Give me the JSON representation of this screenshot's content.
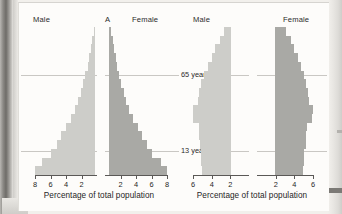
{
  "figures": [
    {
      "panel_label": "A",
      "male_label": "Male",
      "female_label": "Female",
      "axis_title": "Percentage of total population",
      "reference_lines": [
        {
          "label": "65 years",
          "value": 65
        },
        {
          "label": "13 years",
          "value": 13
        }
      ]
    },
    {
      "panel_label": "",
      "male_label": "Male",
      "female_label": "Female",
      "axis_title": "Percentage of total population",
      "reference_lines": [
        {
          "label": "65 years",
          "value": 65
        },
        {
          "label": "13 years",
          "value": 13
        }
      ]
    }
  ],
  "colors": {
    "male_bar": "#cdcdc9",
    "female_bar": "#a9a9a5",
    "axis": "#5a5856",
    "reference_line": "#c9c7c3",
    "page": "#fdfcfa",
    "text": "#1f1f1f"
  },
  "chart_data": [
    {
      "type": "bar",
      "title": "A",
      "subtitle": "Expansive population pyramid",
      "orientation": "horizontal-pyramid",
      "xlabel": "Percentage of total population",
      "ylabel": "Age group",
      "xlim": [
        -8,
        8
      ],
      "grid": false,
      "legend": "none",
      "left_side_label": "Male",
      "right_side_label": "Female",
      "xticks_left": [
        8,
        6,
        4,
        2
      ],
      "xticks_right": [
        2,
        4,
        6,
        8
      ],
      "categories": [
        "0-4",
        "5-9",
        "10-14",
        "15-19",
        "20-24",
        "25-29",
        "30-34",
        "35-39",
        "40-44",
        "45-49",
        "50-54",
        "55-59",
        "60-64",
        "65-69",
        "70-74",
        "75-79",
        "80+"
      ],
      "series": [
        {
          "name": "Male",
          "values": [
            7.8,
            6.9,
            5.8,
            5.0,
            4.4,
            3.8,
            3.2,
            2.7,
            2.3,
            1.9,
            1.6,
            1.3,
            1.0,
            0.8,
            0.6,
            0.4,
            0.2
          ]
        },
        {
          "name": "Female",
          "values": [
            7.5,
            6.7,
            5.6,
            4.9,
            4.3,
            3.7,
            3.1,
            2.6,
            2.2,
            1.9,
            1.6,
            1.3,
            1.1,
            0.9,
            0.7,
            0.5,
            0.3
          ]
        }
      ],
      "annotations": [
        {
          "text": "65 years",
          "y_category": "65-69"
        },
        {
          "text": "13 years",
          "y_category": "10-14"
        }
      ]
    },
    {
      "type": "bar",
      "title": "",
      "subtitle": "Stationary / constrictive population pyramid",
      "orientation": "horizontal-pyramid",
      "xlabel": "Percentage of total population",
      "ylabel": "Age group",
      "xlim": [
        -6,
        6
      ],
      "grid": false,
      "legend": "none",
      "left_side_label": "Male",
      "right_side_label": "Female",
      "xticks_left": [
        6,
        4,
        2
      ],
      "xticks_right": [
        2,
        4,
        6
      ],
      "categories": [
        "0-4",
        "5-9",
        "10-14",
        "15-19",
        "20-24",
        "25-29",
        "30-34",
        "35-39",
        "40-44",
        "45-49",
        "50-54",
        "55-59",
        "60-64",
        "65-69",
        "70-74",
        "75-79",
        "80+"
      ],
      "series": [
        {
          "name": "Male",
          "values": [
            3.1,
            3.2,
            3.2,
            3.4,
            3.5,
            3.5,
            4.1,
            4.1,
            3.6,
            3.5,
            3.2,
            2.9,
            2.5,
            2.1,
            1.7,
            1.2,
            0.8
          ]
        },
        {
          "name": "Female",
          "values": [
            3.0,
            3.1,
            3.1,
            3.3,
            3.4,
            3.5,
            4.0,
            4.1,
            3.7,
            3.6,
            3.4,
            3.1,
            2.8,
            2.5,
            2.1,
            1.7,
            1.2
          ]
        }
      ],
      "annotations": [
        {
          "text": "65 years",
          "y_category": "65-69"
        },
        {
          "text": "13 years",
          "y_category": "10-14"
        }
      ]
    }
  ]
}
